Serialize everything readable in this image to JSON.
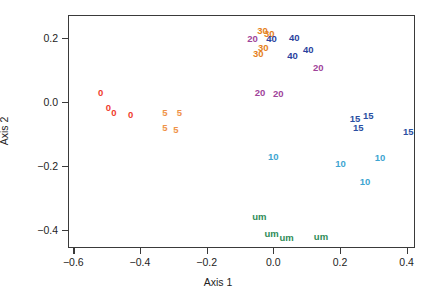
{
  "chart_data": {
    "type": "scatter",
    "title": "",
    "xlabel": "Axis 1",
    "ylabel": "Axis 2",
    "xlim": [
      -0.66,
      0.425
    ],
    "ylim": [
      -0.455,
      0.27
    ],
    "xticks": [
      -0.6,
      -0.4,
      -0.2,
      0.0,
      0.2,
      0.4
    ],
    "xticklabels": [
      "−0.6",
      "−0.4",
      "−0.2",
      "0.0",
      "0.2",
      "0.4"
    ],
    "yticks": [
      0.2,
      0.0,
      -0.2,
      -0.4
    ],
    "yticklabels": [
      "0.2",
      "0.0",
      "−0.2",
      "−0.4"
    ],
    "grid": false,
    "legend": "none",
    "marker_style": "text-label",
    "groups": [
      {
        "name": "0",
        "label": "0",
        "color": "#F03C2E",
        "points": [
          {
            "x": -0.518,
            "y": 0.026
          },
          {
            "x": -0.495,
            "y": -0.021
          },
          {
            "x": -0.478,
            "y": -0.036
          },
          {
            "x": -0.428,
            "y": -0.042
          }
        ]
      },
      {
        "name": "5",
        "label": "5",
        "color": "#EF9248",
        "points": [
          {
            "x": -0.325,
            "y": -0.036
          },
          {
            "x": -0.282,
            "y": -0.036
          },
          {
            "x": -0.325,
            "y": -0.081
          },
          {
            "x": -0.292,
            "y": -0.088
          }
        ]
      },
      {
        "name": "um",
        "label": "um",
        "color": "#2E8B57",
        "points": [
          {
            "x": -0.042,
            "y": -0.359
          },
          {
            "x": -0.005,
            "y": -0.414
          },
          {
            "x": 0.04,
            "y": -0.425
          },
          {
            "x": 0.143,
            "y": -0.422
          }
        ]
      },
      {
        "name": "10",
        "label": "10",
        "color": "#3EA5D1",
        "points": [
          {
            "x": 0.0,
            "y": -0.172
          },
          {
            "x": 0.202,
            "y": -0.195
          },
          {
            "x": 0.32,
            "y": -0.175
          },
          {
            "x": 0.275,
            "y": -0.25
          }
        ]
      },
      {
        "name": "15",
        "label": "15",
        "color": "#2B4FA2",
        "points": [
          {
            "x": 0.245,
            "y": -0.054
          },
          {
            "x": 0.285,
            "y": -0.044
          },
          {
            "x": 0.255,
            "y": -0.081
          },
          {
            "x": 0.405,
            "y": -0.096
          }
        ]
      },
      {
        "name": "20",
        "label": "20",
        "color": "#A0449A",
        "points": [
          {
            "x": -0.062,
            "y": 0.196
          },
          {
            "x": 0.135,
            "y": 0.104
          },
          {
            "x": -0.04,
            "y": 0.026
          },
          {
            "x": 0.015,
            "y": 0.024
          }
        ]
      },
      {
        "name": "30",
        "label": "30",
        "color": "#E5811C",
        "points": [
          {
            "x": -0.032,
            "y": 0.222
          },
          {
            "x": -0.012,
            "y": 0.211
          },
          {
            "x": -0.03,
            "y": 0.169
          },
          {
            "x": -0.045,
            "y": 0.148
          }
        ]
      },
      {
        "name": "40",
        "label": "40",
        "color": "#2B3F9E",
        "points": [
          {
            "x": -0.005,
            "y": 0.196
          },
          {
            "x": 0.063,
            "y": 0.199
          },
          {
            "x": 0.105,
            "y": 0.161
          },
          {
            "x": 0.058,
            "y": 0.142
          }
        ]
      }
    ]
  }
}
